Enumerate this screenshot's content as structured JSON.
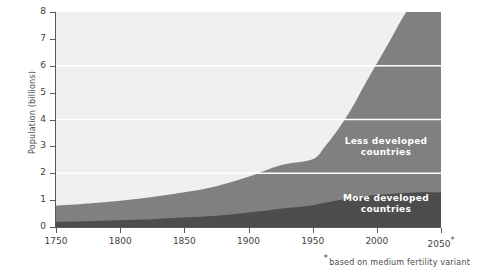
{
  "chart_data": {
    "type": "area",
    "stacked": true,
    "title": "",
    "xlabel": "",
    "ylabel": "Population (billions)",
    "xlim": [
      1750,
      2050
    ],
    "ylim": [
      0,
      8
    ],
    "xticks": [
      "1750",
      "1800",
      "1850",
      "1900",
      "1950",
      "2000",
      "2050*"
    ],
    "xtick_values": [
      1750,
      1800,
      1850,
      1900,
      1950,
      2000,
      2050
    ],
    "yticks": [
      "0",
      "1",
      "2",
      "3",
      "4",
      "5",
      "6",
      "7",
      "8"
    ],
    "ytick_values": [
      0,
      1,
      2,
      3,
      4,
      5,
      6,
      7,
      8
    ],
    "grid": true,
    "gridlines_at": [
      2,
      4,
      6
    ],
    "gridline_color": "#ffffff",
    "plot_background": "#f0f0f0",
    "legend_position": "inline-annotations",
    "x": [
      1750,
      1775,
      1800,
      1825,
      1850,
      1875,
      1900,
      1925,
      1950,
      1960,
      1970,
      1980,
      1990,
      2000,
      2010,
      2020,
      2030,
      2040,
      2050
    ],
    "series": [
      {
        "name": "More developed countries",
        "color": "#4d4d4d",
        "values": [
          0.19,
          0.21,
          0.25,
          0.29,
          0.35,
          0.42,
          0.54,
          0.68,
          0.81,
          0.91,
          1.0,
          1.08,
          1.15,
          1.19,
          1.23,
          1.26,
          1.28,
          1.29,
          1.28
        ]
      },
      {
        "name": "Less developed countries",
        "color": "#808080",
        "values": [
          0.6,
          0.66,
          0.73,
          0.83,
          0.94,
          1.1,
          1.33,
          1.62,
          1.71,
          2.11,
          2.65,
          3.3,
          4.1,
          4.89,
          5.68,
          6.52,
          7.17,
          7.62,
          7.92
        ]
      }
    ],
    "totals": [
      0.79,
      0.87,
      0.98,
      1.12,
      1.29,
      1.52,
      1.87,
      2.3,
      2.52,
      3.02,
      3.65,
      4.38,
      5.25,
      6.08,
      6.91,
      7.78,
      8.45,
      8.91,
      9.2
    ],
    "annotations": [
      {
        "id": "less",
        "text_line1": "Less  developed",
        "text_line2": "countries",
        "color": "#ffffff"
      },
      {
        "id": "more",
        "text_line1": "More  developed",
        "text_line2": "countries",
        "color": "#ffffff"
      }
    ],
    "footnote_star": "*",
    "footnote": "based on medium fertility variant"
  }
}
